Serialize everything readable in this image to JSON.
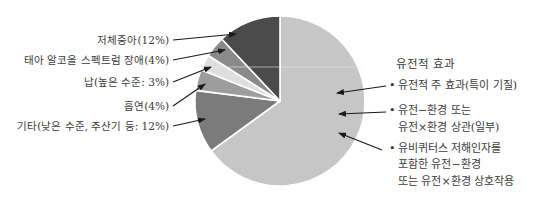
{
  "chart_data": {
    "type": "pie",
    "title": "",
    "start_angle_deg": 0,
    "direction": "clockwise",
    "slices": [
      {
        "label": "유전적 효과",
        "value": 65,
        "color": "#c6c6c6"
      },
      {
        "label": "기타(낮은 수준, 주산기 등: 12%)",
        "value": 12,
        "color": "#7b7b7b"
      },
      {
        "label": "흡연(4%)",
        "value": 4,
        "color": "#9d9d9d"
      },
      {
        "label": "납(높은 수준: 3%)",
        "value": 3,
        "color": "#dedede"
      },
      {
        "label": "태아 알코올 스펙트럼 장애(4%)",
        "value": 4,
        "color": "#8a8a8a"
      },
      {
        "label": "저체중아(12%)",
        "value": 12,
        "color": "#4b4b4b"
      }
    ],
    "legend": {
      "title": "유전적 효과",
      "items": [
        {
          "lines": [
            "유전적 주 효과(특이 기질)"
          ]
        },
        {
          "lines": [
            "유전−환경 또는",
            "유전×환경 상관(일부)"
          ]
        },
        {
          "lines": [
            "유비퀴터스 저해인자를",
            "포함한 유전−환경",
            "또는 유전×환경 상호작용"
          ]
        }
      ]
    }
  },
  "labels": {
    "low_birth_weight": "저체중아(12%)",
    "fasd": "태아 알코올 스펙트럼 장애(4%)",
    "lead": "납(높은 수준: 3%)",
    "smoking": "흡연(4%)",
    "other": "기타(낮은 수준, 주산기 등: 12%)"
  },
  "legend": {
    "title": "유전적 효과",
    "item1_line1": "유전적 주 효과(특이 기질)",
    "item2_line1": "유전−환경 또는",
    "item2_line2": "유전×환경 상관(일부)",
    "item3_line1": "유비퀴터스 저해인자를",
    "item3_line2": "포함한 유전−환경",
    "item3_line3": "또는 유전×환경 상호작용",
    "bullet": "•"
  }
}
